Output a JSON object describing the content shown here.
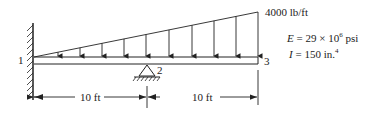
{
  "diagram": {
    "type": "beam",
    "load": {
      "max_intensity": "4000 lb/ft",
      "distribution": "linearly varying (triangular), zero at node 1 to max at node 3"
    },
    "nodes": [
      {
        "id": "1",
        "support": "fixed wall"
      },
      {
        "id": "2",
        "support": "pin"
      },
      {
        "id": "3",
        "support": "free"
      }
    ],
    "dimensions": [
      {
        "label": "10 ft",
        "from": "1",
        "to": "2"
      },
      {
        "label": "10 ft",
        "from": "2",
        "to": "3"
      }
    ],
    "properties": {
      "E_symbol": "E",
      "E_eq": " = 29 × 10",
      "E_exp": "6",
      "E_unit": " psi",
      "I_symbol": "I",
      "I_eq": " = 150 in.",
      "I_exp": "4"
    }
  },
  "labels": {
    "node1": "1",
    "node2": "2",
    "node3": "3",
    "load": "4000 lb/ft",
    "dim1": "10 ft",
    "dim2": "10 ft"
  }
}
